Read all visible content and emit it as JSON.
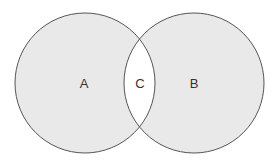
{
  "diagram": {
    "type": "venn",
    "sets": [
      {
        "id": "A",
        "label": "A",
        "cx": 85,
        "cy": 83,
        "r": 70
      },
      {
        "id": "B",
        "label": "B",
        "cx": 194,
        "cy": 83,
        "r": 70
      }
    ],
    "intersection": {
      "id": "C",
      "label": "C"
    },
    "colors": {
      "fill": "#e9e9e9",
      "intersection_fill": "#ffffff",
      "stroke": "#555555",
      "text": "#333333",
      "background": "#ffffff"
    }
  }
}
